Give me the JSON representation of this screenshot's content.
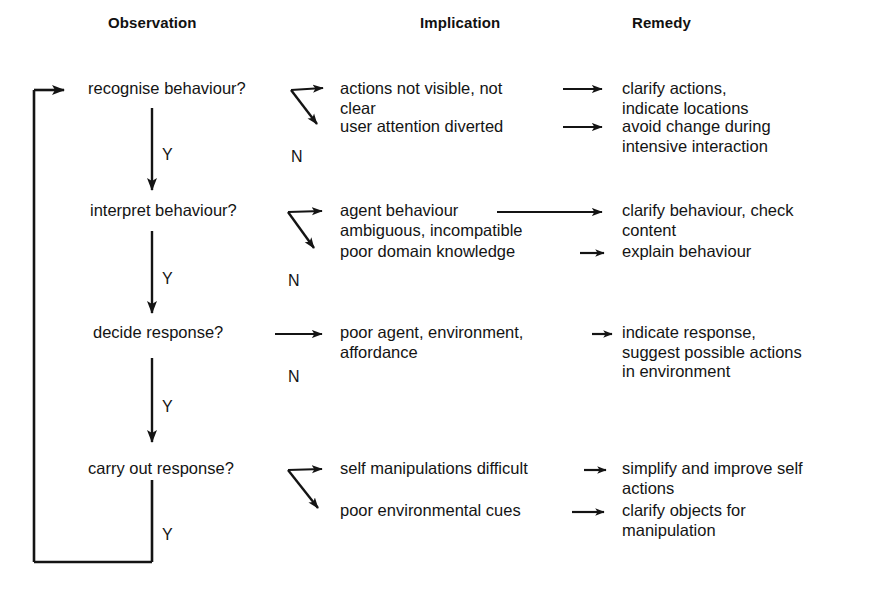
{
  "diagram": {
    "columns": [
      {
        "id": "observation",
        "label": "Observation"
      },
      {
        "id": "implication",
        "label": "Implication"
      },
      {
        "id": "remedy",
        "label": "Remedy"
      }
    ],
    "colors": {
      "ink": "#141414",
      "background": "#ffffff"
    },
    "branch_labels": {
      "yes": "Y",
      "no": "N"
    },
    "rows": [
      {
        "id": "recognise",
        "observation": "recognise behaviour?",
        "yes_label": "Y",
        "no_label": "N",
        "branches": [
          {
            "implication": "actions not visible, not\nclear",
            "remedy": "clarify actions,\nindicate locations"
          },
          {
            "implication": "user attention diverted",
            "remedy": "avoid change during\nintensive interaction"
          }
        ]
      },
      {
        "id": "interpret",
        "observation": "interpret behaviour?",
        "yes_label": "Y",
        "no_label": "N",
        "branches": [
          {
            "implication": "agent behaviour\nambiguous, incompatible",
            "remedy": "clarify behaviour, check\ncontent"
          },
          {
            "implication": "poor domain knowledge",
            "remedy": "explain behaviour"
          }
        ]
      },
      {
        "id": "decide",
        "observation": "decide response?",
        "yes_label": "Y",
        "no_label": "N",
        "branches": [
          {
            "implication": "poor agent, environment,\naffordance",
            "remedy": "indicate response,\nsuggest possible actions\nin environment"
          }
        ]
      },
      {
        "id": "carry-out",
        "observation": "carry out response?",
        "yes_label": "Y",
        "no_label": "N",
        "branches": [
          {
            "implication": "self manipulations difficult",
            "remedy": "simplify and improve self\nactions"
          },
          {
            "implication": "poor environmental cues",
            "remedy": "clarify objects for\nmanipulation"
          }
        ]
      }
    ]
  }
}
